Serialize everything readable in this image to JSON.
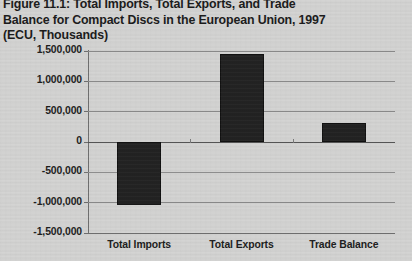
{
  "figure": {
    "title": "Figure 11.1: Total Imports, Total Exports, and Trade\nBalance for Compact Discs in the European Union, 1997\n(ECU, Thousands)"
  },
  "colors": {
    "paper": "#d3d3d2",
    "bar": "#222222",
    "grid": "#8a8a8a",
    "axis": "#6e6e6e",
    "text": "#1d1d1d"
  },
  "chart_data": {
    "type": "bar",
    "title": "Figure 11.1: Total Imports, Total Exports, and Trade Balance for Compact Discs in the European Union, 1997 (ECU, Thousands)",
    "categories": [
      "Total Imports",
      "Total Exports",
      "Trade Balance"
    ],
    "values": [
      -1040000,
      1450000,
      310000
    ],
    "series": [
      {
        "name": "ECU (Thousands)",
        "values": [
          -1040000,
          1450000,
          310000
        ]
      }
    ],
    "xlabel": "",
    "ylabel": "",
    "ylim": [
      -1500000,
      1500000
    ],
    "ytick_step": 500000,
    "yticks": [
      1500000,
      1000000,
      500000,
      0,
      -500000,
      -1000000,
      -1500000
    ],
    "ytick_labels": [
      "1,500,000",
      "1,000,000",
      "500,000",
      "0",
      "-500,000",
      "-1,000,000",
      "-1,500,000"
    ],
    "grid": true,
    "grid_axis": "y",
    "legend": false,
    "legend_position": "none",
    "zero_line": true,
    "units": "ECU, Thousands"
  }
}
